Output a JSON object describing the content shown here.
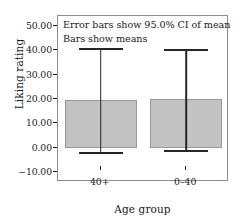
{
  "chart_data": {
    "type": "bar",
    "title": "",
    "subtitle": "",
    "xlabel": "Age group",
    "ylabel": "Liking rating",
    "categories": [
      "40+",
      "0–40"
    ],
    "values": [
      19.5,
      19.8
    ],
    "error_low": [
      -1.8,
      -1.0
    ],
    "error_high": [
      41.0,
      40.5
    ],
    "error_description": "95.0% CI of mean",
    "ylim": [
      -14,
      54
    ],
    "yticks": [
      -10,
      0,
      10,
      20,
      30,
      40,
      50
    ],
    "ytick_labels": [
      "−10.00",
      "0.00",
      "10.00",
      "20.00",
      "30.00",
      "40.00",
      "50.00"
    ],
    "grid": false,
    "legend": "none",
    "annotations": [
      "Error bars show 95.0% CI of mean",
      "Bars show means"
    ],
    "bar_fill_color": "#c2c2c2",
    "bar_edge_color": "#9a9a9a",
    "error_bar_color": "#262626",
    "frame_color": "#8c8c8c",
    "background_color": "#ffffff"
  }
}
